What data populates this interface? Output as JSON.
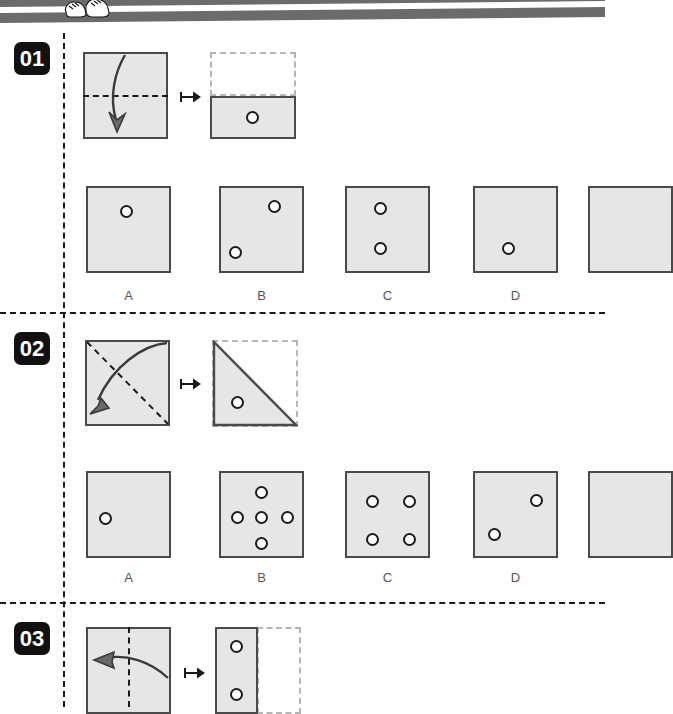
{
  "page": {
    "width": 605,
    "height": 707,
    "background": "#ffffff",
    "paper_fill": "#e6e6e6",
    "paper_stroke": "#4a4a4a",
    "ghost_stroke": "#b5b5b5",
    "rail_color": "#1a1a1a",
    "badge_bg": "#111111",
    "badge_fg": "#ffffff",
    "label_color": "#555555",
    "band_color": "#6b6b6b"
  },
  "header": {
    "mascot_icon": "shoes-mascot-icon"
  },
  "questions": [
    {
      "id": "q01",
      "number": "01",
      "fold": {
        "start_shape": "square",
        "crease": "horizontal-middle",
        "arrow": "fold-top-down",
        "map_icon": "maps-to-arrow-icon",
        "result_shape": "bottom-half-rectangle",
        "result_holes": 1
      },
      "options": [
        {
          "letter": "A",
          "holes": 1
        },
        {
          "letter": "B",
          "holes": 2
        },
        {
          "letter": "C",
          "holes": 2
        },
        {
          "letter": "D",
          "holes": 1
        },
        {
          "letter": "",
          "holes": 0
        }
      ]
    },
    {
      "id": "q02",
      "number": "02",
      "fold": {
        "start_shape": "square",
        "crease": "diagonal-tl-br",
        "arrow": "fold-corner-tr-to-bl",
        "map_icon": "maps-to-arrow-icon",
        "result_shape": "lower-left-triangle",
        "result_holes": 1
      },
      "options": [
        {
          "letter": "A",
          "holes": 1
        },
        {
          "letter": "B",
          "holes": 5
        },
        {
          "letter": "C",
          "holes": 4
        },
        {
          "letter": "D",
          "holes": 2
        },
        {
          "letter": "",
          "holes": 0
        }
      ]
    },
    {
      "id": "q03",
      "number": "03",
      "fold": {
        "start_shape": "square",
        "crease": "vertical-middle",
        "arrow": "fold-right-to-left",
        "map_icon": "maps-to-arrow-icon",
        "result_shape": "left-half-rectangle",
        "result_holes": 2
      },
      "options": []
    }
  ],
  "labels": {
    "a": "A",
    "b": "B",
    "c": "C",
    "d": "D"
  }
}
